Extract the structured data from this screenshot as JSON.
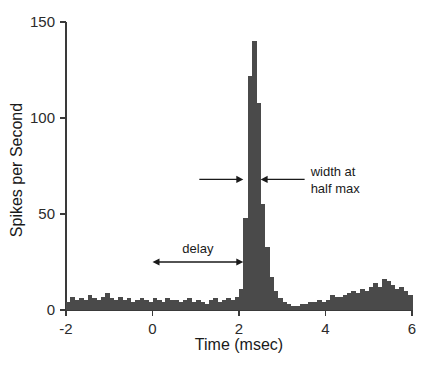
{
  "chart_data": {
    "type": "bar",
    "title": "",
    "subtitle": "",
    "xlabel": "Time (msec)",
    "ylabel": "Spikes per Second",
    "xlim": [
      -2,
      6
    ],
    "ylim": [
      0,
      150
    ],
    "xticks": [
      -2,
      0,
      2,
      4,
      6
    ],
    "xtick_labels": [
      "-2",
      "0",
      "2",
      "4",
      "6"
    ],
    "yticks": [
      0,
      50,
      100,
      150
    ],
    "ytick_labels": [
      "0",
      "50",
      "100",
      "150"
    ],
    "grid": false,
    "legend": "none",
    "bin_width": 0.1,
    "bar_color": "#4a4a4a",
    "x": [
      -2.0,
      -1.9,
      -1.8,
      -1.7,
      -1.6,
      -1.5,
      -1.4,
      -1.3,
      -1.2,
      -1.1,
      -1.0,
      -0.9,
      -0.8,
      -0.7,
      -0.6,
      -0.5,
      -0.4,
      -0.3,
      -0.2,
      -0.1,
      0.0,
      0.1,
      0.2,
      0.3,
      0.4,
      0.5,
      0.6,
      0.7,
      0.8,
      0.9,
      1.0,
      1.1,
      1.2,
      1.3,
      1.4,
      1.5,
      1.6,
      1.7,
      1.8,
      1.9,
      2.0,
      2.1,
      2.2,
      2.3,
      2.4,
      2.5,
      2.6,
      2.7,
      2.8,
      2.9,
      3.0,
      3.1,
      3.2,
      3.3,
      3.4,
      3.5,
      3.6,
      3.7,
      3.8,
      3.9,
      4.0,
      4.1,
      4.2,
      4.3,
      4.4,
      4.5,
      4.6,
      4.7,
      4.8,
      4.9,
      5.0,
      5.1,
      5.2,
      5.3,
      5.4,
      5.5,
      5.6,
      5.7,
      5.8,
      5.9
    ],
    "values": [
      4,
      7,
      5,
      6,
      5,
      8,
      6,
      5,
      7,
      9,
      6,
      5,
      7,
      5,
      6,
      4,
      5,
      6,
      5,
      4,
      6,
      5,
      4,
      6,
      5,
      5,
      4,
      5,
      6,
      4,
      5,
      4,
      3,
      5,
      6,
      4,
      5,
      6,
      5,
      7,
      11,
      48,
      122,
      140,
      108,
      55,
      33,
      17,
      10,
      6,
      4,
      3,
      2,
      2,
      3,
      3,
      4,
      4,
      5,
      4,
      5,
      8,
      7,
      7,
      8,
      9,
      10,
      9,
      11,
      10,
      12,
      14,
      12,
      16,
      15,
      13,
      11,
      12,
      10,
      8
    ],
    "peak_value": 140,
    "peak_time": 2.3,
    "baseline_level": 5,
    "annotations": [
      {
        "id": "delay",
        "label": "delay",
        "type": "double-arrow",
        "x_start": 0.0,
        "x_end": 2.1,
        "y": 25
      },
      {
        "id": "width-at-half-max",
        "label": "width at half max",
        "label_line_1": "width at",
        "label_line_2": "half max",
        "type": "inward-arrows",
        "x_left": 2.1,
        "x_right": 2.5,
        "y": 68
      }
    ]
  }
}
